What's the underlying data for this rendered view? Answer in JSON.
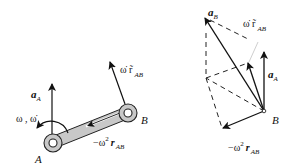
{
  "figure": {
    "left_panel": {
      "labels": {
        "a_A": {
          "main": "a",
          "sub": "A"
        },
        "omega": "ω , ω̇",
        "omega_dot_r": {
          "main": "ω̇ r̃",
          "sub": "AB"
        },
        "neg_omega2_r": {
          "pre": "−ω",
          "sup": "2",
          "main": "r",
          "sub": "AB"
        },
        "point_A": "A",
        "point_B": "B"
      }
    },
    "right_panel": {
      "labels": {
        "a_B": {
          "main": "a",
          "sub": "B"
        },
        "omega_dot_r": {
          "main": "ω̇ r̃",
          "sub": "AB"
        },
        "a_A": {
          "main": "a",
          "sub": "A"
        },
        "point_B": "B",
        "neg_omega2_r": {
          "pre": "−ω",
          "sup": "2",
          "main": "r",
          "sub": "AB"
        }
      }
    },
    "colors": {
      "ink": "#111111",
      "link_fill": "#c8c8c8",
      "dash": "#222222",
      "faint_line": "#cfcfcf"
    }
  }
}
